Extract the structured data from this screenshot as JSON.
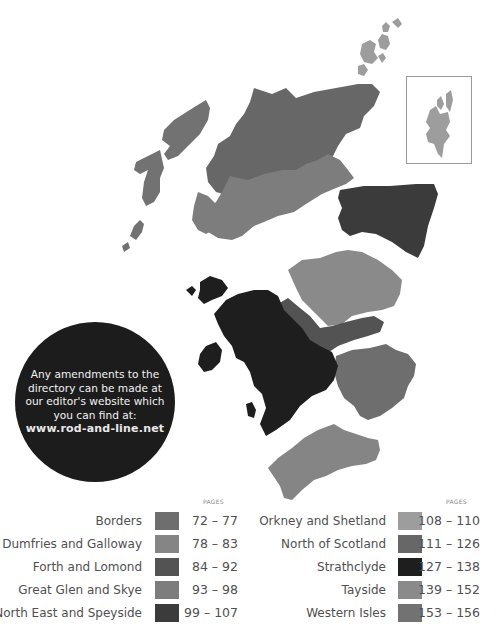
{
  "callout": {
    "lines": [
      "Any amendments to the",
      "directory can be made at",
      "our editor's website which",
      "you can find at:"
    ],
    "url": "www.rod-and-line.net"
  },
  "legend": {
    "pages_header": "PAGES",
    "left": [
      {
        "name": "Borders",
        "range": "72 – 77",
        "color": "#6e6e6e"
      },
      {
        "name": "Dumfries and Galloway",
        "range": "78 – 83",
        "color": "#858585"
      },
      {
        "name": "Forth and Lomond",
        "range": "84 – 92",
        "color": "#535353"
      },
      {
        "name": "Great Glen and Skye",
        "range": "93 – 98",
        "color": "#7d7d7d"
      },
      {
        "name": "North East and Speyside",
        "range": "99 – 107",
        "color": "#3b3b3b"
      }
    ],
    "right": [
      {
        "name": "Orkney and Shetland",
        "range": "108 – 110",
        "color": "#9d9d9d"
      },
      {
        "name": "North of Scotland",
        "range": "111 – 126",
        "color": "#676767"
      },
      {
        "name": "Strathclyde",
        "range": "127 – 138",
        "color": "#1e1e1e"
      },
      {
        "name": "Tayside",
        "range": "139 – 152",
        "color": "#8a8a8a"
      },
      {
        "name": "Western Isles",
        "range": "153 – 156",
        "color": "#727272"
      }
    ]
  }
}
